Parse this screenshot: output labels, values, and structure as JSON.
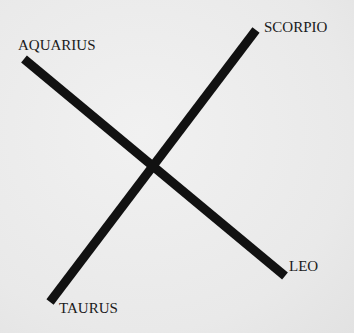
{
  "diagram": {
    "type": "crossing-lines",
    "labels": {
      "top_left": "AQUARIUS",
      "top_right": "SCORPIO",
      "bottom_right": "LEO",
      "bottom_left": "TAURUS"
    },
    "lines": [
      {
        "from": "AQUARIUS",
        "to": "LEO",
        "x1": 24,
        "y1": 59,
        "x2": 285,
        "y2": 276
      },
      {
        "from": "SCORPIO",
        "to": "TAURUS",
        "x1": 256,
        "y1": 30,
        "x2": 50,
        "y2": 302
      }
    ],
    "line_color": "#111111",
    "background_color": "#ececec"
  }
}
